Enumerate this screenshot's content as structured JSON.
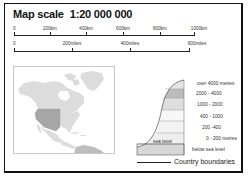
{
  "title": {
    "label": "Map scale",
    "ratio": "1:20 000 000"
  },
  "scale_km": {
    "ticks": [
      "0",
      "200km",
      "400km",
      "600km",
      "800km",
      "1000km"
    ]
  },
  "scale_miles": {
    "ticks": [
      "0",
      "200miles",
      "400miles",
      "600miles"
    ]
  },
  "inset_map": {
    "region": "North America",
    "highlight": "Western United States",
    "colors": {
      "land": "#dcdcdc",
      "highlight": "#a6a6a6",
      "south": "#bdbdbd",
      "water": "#ffffff"
    }
  },
  "elevation_key": {
    "sea_level_label": "sea level",
    "bands": [
      {
        "label": "over 4000 metres",
        "color": "#e4e4e4"
      },
      {
        "label": "2000 - 4000",
        "color": "#bcbcbc"
      },
      {
        "label": "1000 - 2000",
        "color": "#dedede"
      },
      {
        "label": "400 - 1000",
        "color": "#f7f7f7"
      },
      {
        "label": "200 -400",
        "color": "#f3f3f3"
      },
      {
        "label": "0 - 200 metres",
        "color": "#eeeeee"
      },
      {
        "label": "below sea level",
        "color": "#d7d7d7"
      }
    ]
  },
  "legend": {
    "country_boundaries": "Country boundaries"
  }
}
